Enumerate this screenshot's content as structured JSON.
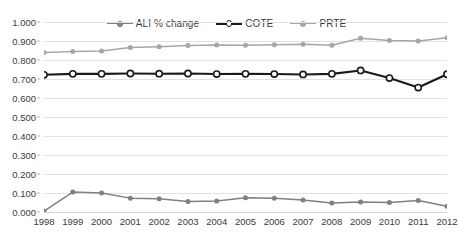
{
  "chart_data": {
    "type": "line",
    "title": "",
    "subtitle": "",
    "xlabel": "",
    "ylabel": "",
    "x": [
      "1998",
      "1999",
      "2000",
      "2001",
      "2002",
      "2003",
      "2004",
      "2005",
      "2006",
      "2007",
      "2008",
      "2009",
      "2010",
      "2011",
      "2012"
    ],
    "categories": [
      "1998",
      "1999",
      "2000",
      "2001",
      "2002",
      "2003",
      "2004",
      "2005",
      "2006",
      "2007",
      "2008",
      "2009",
      "2010",
      "2011",
      "2012"
    ],
    "series": [
      {
        "name": "ALI  % change",
        "color": "#808080",
        "marker": "filled-circle",
        "line_style": "solid",
        "values": [
          0.005,
          0.105,
          0.1,
          0.073,
          0.07,
          0.055,
          0.058,
          0.075,
          0.072,
          0.063,
          0.048,
          0.052,
          0.05,
          0.06,
          0.03
        ]
      },
      {
        "name": "COTE",
        "color": "#1a1a1a",
        "marker": "open-circle",
        "line_style": "solid",
        "values": [
          0.722,
          0.727,
          0.727,
          0.729,
          0.728,
          0.729,
          0.726,
          0.727,
          0.726,
          0.724,
          0.727,
          0.745,
          0.705,
          0.655,
          0.725
        ]
      },
      {
        "name": "PRTE",
        "color": "#a6a6a6",
        "marker": "filled-circle",
        "line_style": "solid",
        "values": [
          0.84,
          0.845,
          0.847,
          0.866,
          0.87,
          0.876,
          0.879,
          0.878,
          0.88,
          0.883,
          0.878,
          0.915,
          0.902,
          0.9,
          0.917
        ]
      }
    ],
    "ylim": [
      0.0,
      1.0
    ],
    "y_ticks": [
      "0.000",
      "0.100",
      "0.200",
      "0.300",
      "0.400",
      "0.500",
      "0.600",
      "0.700",
      "0.800",
      "0.900",
      "1.000"
    ],
    "y_tick_values": [
      0.0,
      0.1,
      0.2,
      0.3,
      0.4,
      0.5,
      0.6,
      0.7,
      0.8,
      0.9,
      1.0
    ],
    "grid": true,
    "grid_axis": "y",
    "legend_position": "top-center",
    "background": "#ffffff",
    "grid_color": "#e2e2e2"
  },
  "legend": {
    "entries": [
      {
        "label": "ALI  % change"
      },
      {
        "label": "COTE"
      },
      {
        "label": "PRTE"
      }
    ]
  }
}
